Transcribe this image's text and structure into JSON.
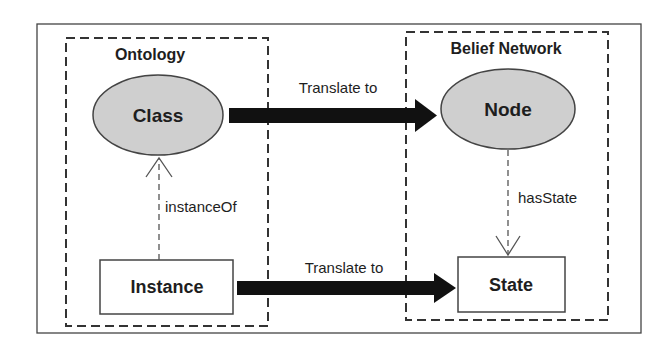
{
  "diagram": {
    "groups": [
      {
        "id": "ontology",
        "label": "Ontology"
      },
      {
        "id": "belief_network",
        "label": "Belief Network"
      }
    ],
    "nodes": {
      "class": {
        "label": "Class",
        "shape": "ellipse",
        "fill": "#cfcfcf"
      },
      "node": {
        "label": "Node",
        "shape": "ellipse",
        "fill": "#cfcfcf"
      },
      "instance": {
        "label": "Instance",
        "shape": "rectangle",
        "fill": "#ffffff"
      },
      "state": {
        "label": "State",
        "shape": "rectangle",
        "fill": "#ffffff"
      }
    },
    "edges": {
      "class_to_node": {
        "label": "Translate to",
        "style": "thick-solid"
      },
      "instance_to_state": {
        "label": "Translate to",
        "style": "thick-solid"
      },
      "instance_of": {
        "label": "instanceOf",
        "style": "dashed-open-arrow"
      },
      "has_state": {
        "label": "hasState",
        "style": "dashed-open-arrow"
      }
    },
    "colors": {
      "stroke": "#333333",
      "arrow": "#111111",
      "ellipse_fill": "#cfcfcf"
    }
  }
}
